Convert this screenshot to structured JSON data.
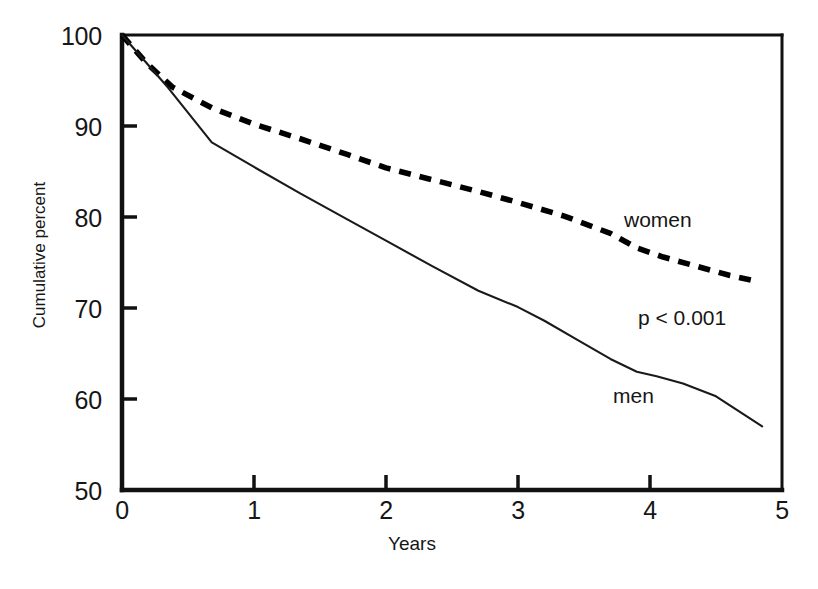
{
  "chart_data": {
    "type": "line",
    "title": "",
    "xlabel": "Years",
    "ylabel": "Cumulative percent",
    "xlim": [
      0,
      5
    ],
    "ylim": [
      50,
      100
    ],
    "xticks": [
      "0",
      "1",
      "2",
      "3",
      "4",
      "5"
    ],
    "yticks": [
      "50",
      "60",
      "70",
      "80",
      "90",
      "100"
    ],
    "grid": false,
    "legend_position": "inline-annotation",
    "annotations": [
      {
        "name": "p-value",
        "text": "p < 0.001",
        "x": 3.9,
        "y": 68.0
      },
      {
        "name": "women-series-label",
        "text": "women",
        "x": 3.8,
        "y": 79.0
      },
      {
        "name": "men-series-label",
        "text": "men",
        "x": 3.7,
        "y": 60.5
      }
    ],
    "series": [
      {
        "name": "women",
        "label": "women",
        "style": "dashed",
        "color": "#000000",
        "x": [
          0.0,
          0.18,
          0.38,
          0.68,
          1.0,
          1.35,
          1.7,
          2.0,
          2.35,
          2.7,
          3.0,
          3.35,
          3.7,
          3.9,
          4.1,
          4.4,
          4.6,
          4.82
        ],
        "y": [
          100.0,
          97.0,
          94.3,
          92.0,
          90.2,
          88.6,
          86.9,
          85.4,
          84.1,
          82.8,
          81.6,
          80.1,
          78.2,
          76.6,
          75.6,
          74.4,
          73.6,
          72.9
        ]
      },
      {
        "name": "men",
        "label": "men",
        "style": "solid",
        "color": "#1a1a1a",
        "x": [
          0.0,
          0.35,
          0.68,
          1.0,
          1.35,
          1.7,
          2.0,
          2.35,
          2.7,
          3.0,
          3.2,
          3.45,
          3.7,
          3.9,
          4.05,
          4.25,
          4.5,
          4.85
        ],
        "y": [
          100.0,
          94.2,
          88.2,
          85.5,
          82.6,
          79.8,
          77.4,
          74.6,
          71.9,
          70.1,
          68.6,
          66.5,
          64.4,
          63.0,
          62.5,
          61.7,
          60.3,
          57.0
        ]
      }
    ]
  },
  "axis": {
    "x_label": "Years",
    "y_label": "Cumulative percent",
    "x_tick_labels": [
      "0",
      "1",
      "2",
      "3",
      "4",
      "5"
    ],
    "y_tick_labels": [
      "100",
      "90",
      "80",
      "70",
      "60",
      "50"
    ]
  }
}
